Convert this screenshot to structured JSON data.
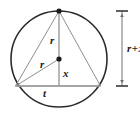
{
  "figure": {
    "kind": "geometry-diagram",
    "background_color": "#ffffff",
    "stroke_color": "#2b2b2b",
    "inner_stroke_color": "#8a8a8a",
    "label_color": "#1a1a1a",
    "circle": {
      "center_x": 59,
      "center_y": 59,
      "radius": 48
    },
    "center_dot": {
      "x": 59,
      "y": 59,
      "radius": 2.6
    },
    "apex_dot": {
      "x": 59,
      "y": 11,
      "radius": 2.6
    },
    "triangle": {
      "apex": {
        "x": 59,
        "y": 11
      },
      "left": {
        "x": 15.5,
        "y": 86
      },
      "right": {
        "x": 100.5,
        "y": 86
      }
    },
    "labels": {
      "radius_vertical": "r",
      "radius_diagonal": "r",
      "offset_vertical": "x",
      "base_chord": "t",
      "dimension": {
        "left_term": "r",
        "operator": "+",
        "right_term": "x",
        "full": "r + x"
      }
    },
    "dimension_line": {
      "x": 122,
      "y_top": 11,
      "y_bottom": 86,
      "tick_half_width": 6
    }
  }
}
